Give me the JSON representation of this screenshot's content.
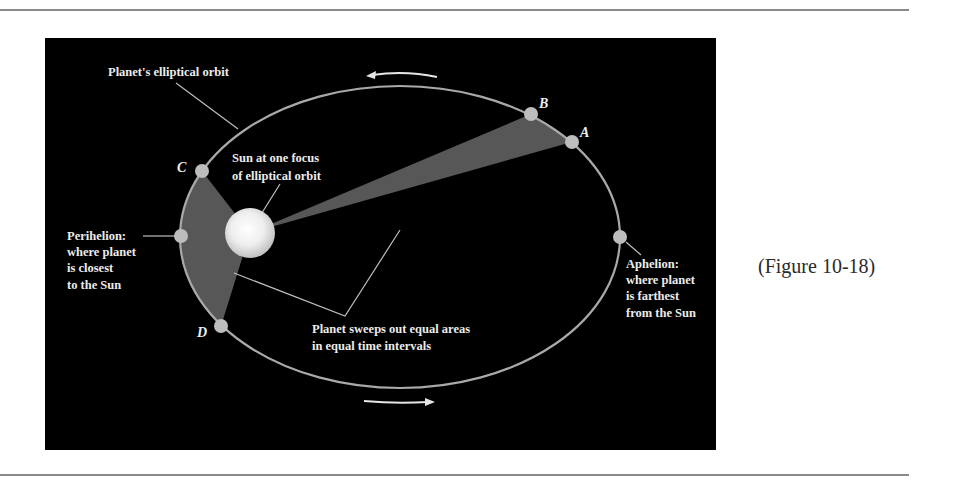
{
  "figure": {
    "caption": "(Figure 10-18)",
    "colors": {
      "background": "#000000",
      "orbit": "#a9a9a9",
      "swept_area": "#575757",
      "planet": "#bdbdbd",
      "sun_center": "#ffffff",
      "sun_edge": "#c9c9c9",
      "text": "#ececec",
      "rule": "#8a8a8a"
    },
    "labels": {
      "orbit": "Planet's elliptical orbit",
      "sun_line1": "Sun at one focus",
      "sun_line2": "of elliptical orbit",
      "perihelion_line1": "Perihelion:",
      "perihelion_line2": "where planet",
      "perihelion_line3": "is closest",
      "perihelion_line4": "to the Sun",
      "aphelion_line1": "Aphelion:",
      "aphelion_line2": "where planet",
      "aphelion_line3": "is farthest",
      "aphelion_line4": "from the Sun",
      "sweep_line1": "Planet sweeps out equal areas",
      "sweep_line2": "in equal time intervals"
    },
    "points": {
      "A": "A",
      "B": "B",
      "C": "C",
      "D": "D"
    },
    "orbit_direction": "counterclockwise",
    "icons": {
      "upper_arrow": "arrow-left-icon",
      "lower_arrow": "arrow-right-icon"
    }
  }
}
